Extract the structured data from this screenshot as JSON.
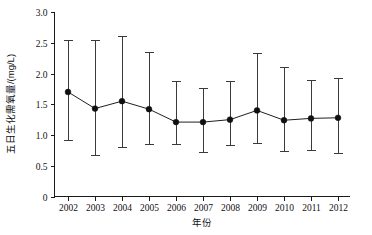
{
  "chart_data": {
    "type": "line",
    "title": "",
    "xlabel": "年份",
    "ylabel": "五日生化需氧量/(mg/L)",
    "categories": [
      "2002",
      "2003",
      "2004",
      "2005",
      "2006",
      "2007",
      "2008",
      "2009",
      "2010",
      "2011",
      "2012"
    ],
    "values": [
      1.7,
      1.43,
      1.55,
      1.42,
      1.21,
      1.21,
      1.25,
      1.4,
      1.24,
      1.27,
      1.28
    ],
    "error_upper": [
      2.54,
      2.54,
      2.61,
      2.35,
      1.88,
      1.76,
      1.87,
      2.33,
      2.1,
      1.89,
      1.92
    ],
    "error_lower": [
      0.92,
      0.68,
      0.8,
      0.85,
      0.86,
      0.72,
      0.83,
      0.87,
      0.74,
      0.75,
      0.7
    ],
    "ylim": [
      0,
      3.0
    ],
    "yticks": [
      "0",
      "0.5",
      "1.0",
      "1.5",
      "2.0",
      "2.5",
      "3.0"
    ],
    "ytick_values": [
      0,
      0.5,
      1.0,
      1.5,
      2.0,
      2.5,
      3.0
    ],
    "grid": false,
    "legend": "none",
    "marker": "filled-circle",
    "errorbar_style": "capped-vertical",
    "series_color": "#1f1f1f"
  }
}
